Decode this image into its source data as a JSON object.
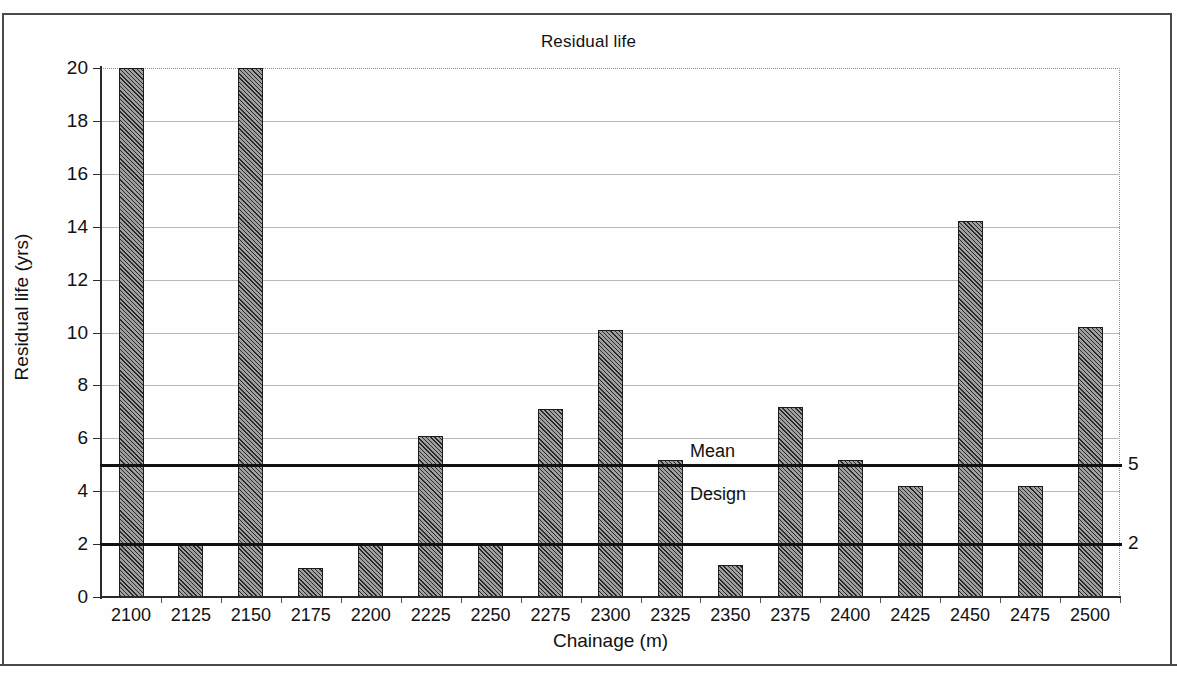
{
  "chart_data": {
    "type": "bar",
    "title": "Residual life",
    "xlabel": "Chainage (m)",
    "ylabel": "Residual life (yrs)",
    "categories": [
      "2100",
      "2125",
      "2150",
      "2175",
      "2200",
      "2225",
      "2250",
      "2275",
      "2300",
      "2325",
      "2350",
      "2375",
      "2400",
      "2425",
      "2450",
      "2475",
      "2500"
    ],
    "values": [
      20.0,
      2.0,
      20.0,
      1.1,
      2.0,
      6.1,
      2.0,
      7.1,
      10.1,
      5.2,
      1.2,
      7.2,
      5.2,
      4.2,
      14.2,
      4.2,
      10.2
    ],
    "ylim": [
      0,
      20
    ],
    "ytick_values": [
      "0",
      "2",
      "4",
      "6",
      "8",
      "10",
      "12",
      "14",
      "16",
      "18",
      "20"
    ],
    "grid": true,
    "legend": "none",
    "bar_color": "#777777",
    "bar_edge_color": "#1b1b1b",
    "gridline_color": "#b9b9b9",
    "axis_color": "#2a2a2a",
    "annotations": [
      {
        "name": "mean",
        "label": "Mean",
        "value": 5,
        "value_label": "5",
        "color": "#111111"
      },
      {
        "name": "design",
        "label": "Design",
        "value": 2,
        "value_label": "2",
        "color": "#111111"
      }
    ]
  }
}
